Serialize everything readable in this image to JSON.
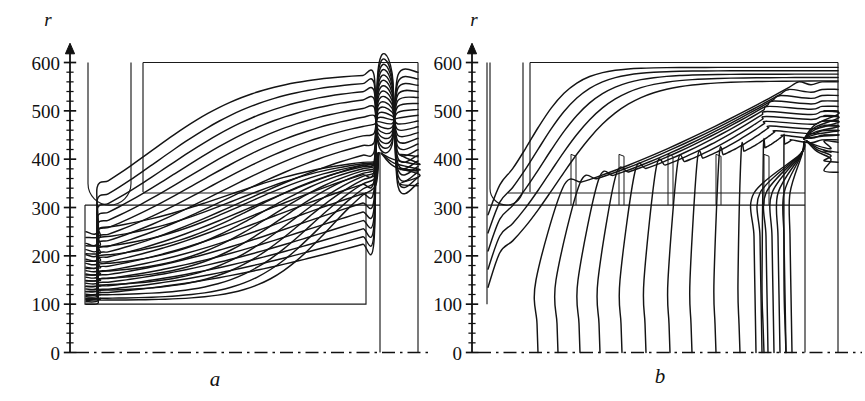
{
  "figure": {
    "kind": "two-panel field-line diagram",
    "background": "#ffffff",
    "line_color": "#141414",
    "electrode_color": "#1a1a1a"
  },
  "panels": [
    {
      "id": "a",
      "label": "a",
      "axis": {
        "variable": "r",
        "ticks_major": [
          0,
          100,
          200,
          300,
          400,
          500,
          600
        ],
        "tick_labels": [
          "0",
          "100",
          "200",
          "300",
          "400",
          "500",
          "600"
        ],
        "minor_tick_step": 20,
        "range": [
          0,
          630
        ]
      },
      "axis_baseline_style": "dash-dot",
      "geometry": {
        "u_electrode": {
          "x_left": 88,
          "x_right": 131,
          "top_r": 600,
          "bottom_r": 305,
          "rounded_bottom": true
        },
        "outer_box": {
          "x_left": 143,
          "x_right": 418,
          "top_r": 600
        },
        "strip_upper_r": 330,
        "strip_lower_r": 305,
        "strip_x_left": 143,
        "strip_x_right": 380,
        "inner_box": {
          "x_left": 85,
          "x_right": 366,
          "bottom_r": 100
        },
        "center_rod": {
          "x": 380,
          "top_r": 415,
          "bottom_r": 0
        },
        "right_wall_x": 418,
        "convergence_point": {
          "x": 380,
          "r": 415
        }
      },
      "field_line_count": 20
    },
    {
      "id": "b",
      "label": "b",
      "axis": {
        "variable": "r",
        "ticks_major": [
          0,
          100,
          200,
          300,
          400,
          500,
          600
        ],
        "tick_labels": [
          "0",
          "100",
          "200",
          "300",
          "400",
          "500",
          "600"
        ],
        "minor_tick_step": 20,
        "range": [
          0,
          630
        ]
      },
      "axis_baseline_style": "dash-dot",
      "geometry": {
        "u_electrode": {
          "x_left": 490,
          "x_right": 523,
          "top_r": 600,
          "bottom_r": 305,
          "rounded_bottom": true
        },
        "outer_box": {
          "x_left": 530,
          "x_right": 838,
          "top_r": 600
        },
        "strip_upper_r": 330,
        "strip_lower_r": 305,
        "strip_x_left": 508,
        "strip_x_right": 805,
        "left_wall": {
          "x": 487,
          "top_r": 600,
          "bottom_r": 100
        },
        "pins": {
          "x_positions": [
            571,
            619,
            668,
            716,
            764
          ],
          "top_r": 410,
          "base_r": 305
        },
        "center_rod": {
          "x": 805,
          "top_r": 440,
          "bottom_r": 0
        },
        "right_wall_x": 838,
        "convergence_point": {
          "x": 805,
          "r": 440
        }
      },
      "field_line_count": 20
    }
  ]
}
